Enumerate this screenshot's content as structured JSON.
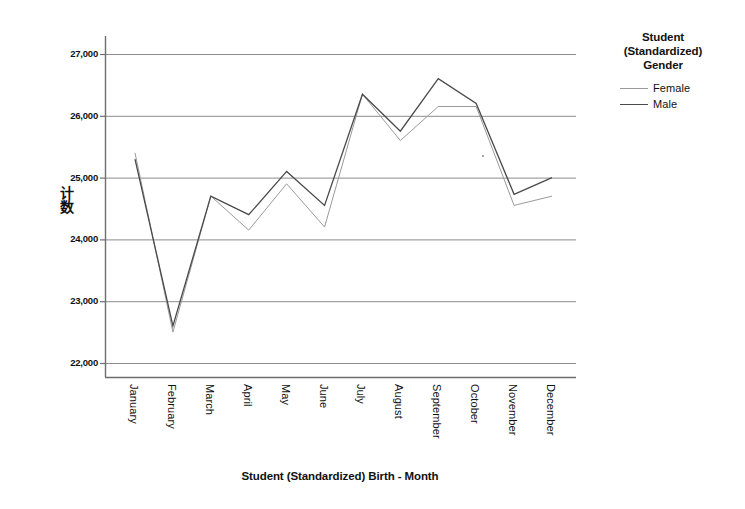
{
  "chart_data": {
    "type": "line",
    "title": "",
    "subtitle": "",
    "xlabel": "Student (Standardized) Birth - Month",
    "ylabel": "计数",
    "categories": [
      "January",
      "February",
      "March",
      "April",
      "May",
      "June",
      "July",
      "August",
      "September",
      "October",
      "November",
      "December"
    ],
    "series": [
      {
        "name": "Female",
        "values": [
          25400,
          22500,
          24700,
          24150,
          24900,
          24200,
          26350,
          25600,
          26150,
          26150,
          24550,
          24700
        ],
        "color": "#9a9a9a",
        "line_style": "thin-gray",
        "line_width": 1
      },
      {
        "name": "Male",
        "values": [
          25300,
          22600,
          24700,
          24400,
          25100,
          24550,
          26350,
          25750,
          26600,
          26200,
          24730,
          25000
        ],
        "color": "#4a4a4a",
        "line_style": "solid",
        "line_width": 1.3
      }
    ],
    "ylim": [
      21700,
      27300
    ],
    "yticks": [
      22000,
      23000,
      24000,
      25000,
      26000,
      27000
    ],
    "ytick_labels": [
      "22,000",
      "23,000",
      "24,000",
      "25,000",
      "26,000",
      "27,000"
    ],
    "grid": true,
    "grid_axis": "y",
    "legend_position": "right",
    "legend_title": "Student\n(Standardized)\nGender"
  },
  "legend": {
    "title_lines": [
      "Student",
      "(Standardized)",
      "Gender"
    ],
    "items": [
      {
        "label": "Female"
      },
      {
        "label": "Male"
      }
    ]
  },
  "axes": {
    "x_title": "Student (Standardized) Birth - Month",
    "y_title": "计数",
    "y_tick_labels": [
      "27,000",
      "26,000",
      "25,000",
      "24,000",
      "23,000",
      "22,000"
    ],
    "x_tick_labels": [
      "January",
      "February",
      "March",
      "April",
      "May",
      "June",
      "July",
      "August",
      "September",
      "October",
      "November",
      "December"
    ]
  },
  "colors": {
    "female_line": "#9a9a9a",
    "male_line": "#4a4a4a",
    "gridline": "#8c8c8c",
    "axis": "#6e6e6e",
    "text": "#111111",
    "background": "#ffffff"
  }
}
